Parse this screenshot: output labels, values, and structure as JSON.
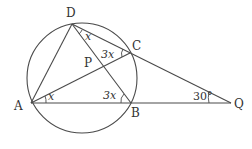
{
  "diagram": {
    "title": "",
    "points": {
      "D": {
        "label": "D",
        "x": 72,
        "y": 24
      },
      "C": {
        "label": "C",
        "x": 130,
        "y": 53
      },
      "P": {
        "label": "P",
        "x": 102,
        "y": 66
      },
      "A": {
        "label": "A",
        "x": 31,
        "y": 103
      },
      "B": {
        "label": "B",
        "x": 131,
        "y": 103
      },
      "Q": {
        "label": "Q",
        "x": 231,
        "y": 103
      }
    },
    "circle": {
      "cx": 82,
      "cy": 78,
      "r": 55
    },
    "segments": [
      [
        "D",
        "A"
      ],
      [
        "D",
        "B"
      ],
      [
        "D",
        "Q"
      ],
      [
        "A",
        "C"
      ],
      [
        "A",
        "Q"
      ]
    ],
    "angles": {
      "ADB": {
        "label": "x"
      },
      "DCA": {
        "label": "3x"
      },
      "CAB": {
        "label": "x"
      },
      "ABD": {
        "label": "3x"
      },
      "AQD": {
        "label": "30°"
      }
    },
    "colors": {
      "stroke": "#4a4a4a",
      "text": "#333333",
      "background": "#ffffff"
    }
  }
}
